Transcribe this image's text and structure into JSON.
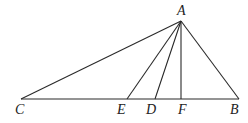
{
  "diagram": {
    "type": "geometry-triangle",
    "points": {
      "A": {
        "x": 181,
        "y": 21,
        "label": "A",
        "lx": 177,
        "ly": 15
      },
      "C": {
        "x": 21,
        "y": 99,
        "label": "C",
        "lx": 15,
        "ly": 114
      },
      "E": {
        "x": 127,
        "y": 99,
        "label": "E",
        "lx": 117,
        "ly": 114
      },
      "D": {
        "x": 155,
        "y": 99,
        "label": "D",
        "lx": 146,
        "ly": 114
      },
      "F": {
        "x": 181,
        "y": 99,
        "label": "F",
        "lx": 178,
        "ly": 114
      },
      "B": {
        "x": 239,
        "y": 99,
        "label": "B",
        "lx": 230,
        "ly": 114
      }
    },
    "segments": [
      [
        "C",
        "B"
      ],
      [
        "A",
        "C"
      ],
      [
        "A",
        "E"
      ],
      [
        "A",
        "D"
      ],
      [
        "A",
        "F"
      ],
      [
        "A",
        "B"
      ]
    ],
    "labels": [
      "A",
      "C",
      "E",
      "D",
      "F",
      "B"
    ]
  }
}
